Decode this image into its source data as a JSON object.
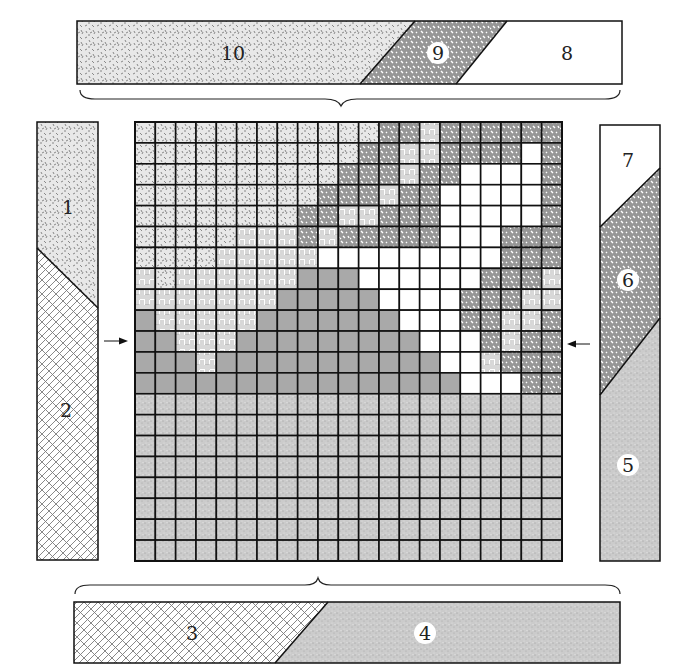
{
  "patterns": {
    "A": {
      "name": "light-speckle",
      "base": "#e6e6e6",
      "mark": "#8a8a8a"
    },
    "C": {
      "name": "dark-mottled",
      "base": "#9a9a9a",
      "mark": "#ffffff"
    },
    "W": {
      "name": "basketweave",
      "base": "#ffffff",
      "mark": "#9a9a9a"
    },
    "O": {
      "name": "white",
      "base": "#ffffff"
    },
    "G": {
      "name": "solid-gray",
      "base": "#a9a9a9"
    },
    "D": {
      "name": "fine-sand",
      "base": "#c8c8c8",
      "mark": "#a0a0a0"
    },
    "X": {
      "name": "crosshatch-maze",
      "base": "#ffffff",
      "mark": "#7a7a7a"
    }
  },
  "grid": {
    "rows": [
      "AAAAAAAAAAAACCWCCCCCC",
      "AAAAAAAAAAACCWWCCCCOC",
      "AAAAAAAAAACCCWCCOOOOC",
      "AAAAAAAAACCCWCCOOOOOC",
      "AAAAAAAACCWWCCCOOOOOC",
      "AAAAAWWWCWCCCCCOOOCCC",
      "AAAAWWWWWOOOOOOOOOCCC",
      "WAWWWWWWGGGOOOOOOCCCW",
      "WWWWWWWGGGGGOOOOCCCWW",
      "GWWWWWGGGGGGGOOOCCWWC",
      "GGWWWGGGGGGGGGOOOCWCC",
      "GGGWGGGGGGGGGGGOOWCCC",
      "GGGGGGGGGGGGGGGGOOOCC",
      "DDDDDDDDDDDDDDDDDDDDD",
      "DDDDDDDDDDDDDDDDDDDDD",
      "DDDDDDDDDDDDDDDDDDDDD",
      "DDDDDDDDDDDDDDDDDDDDD",
      "DDDDDDDDDDDDDDDDDDDDD",
      "DDDDDDDDDDDDDDDDDDDDD",
      "DDDDDDDDDDDDDDDDDDDDD",
      "DDDDDDDDDDDDDDDDDDDDD"
    ]
  },
  "bars": {
    "top": {
      "segments": [
        {
          "label": "10",
          "pattern": "A",
          "circled": false
        },
        {
          "label": "9",
          "pattern": "C",
          "circled": true
        },
        {
          "label": "8",
          "pattern": "O",
          "circled": false
        }
      ]
    },
    "left": {
      "segments": [
        {
          "label": "1",
          "pattern": "A",
          "circled": false
        },
        {
          "label": "2",
          "pattern": "X",
          "circled": false
        }
      ]
    },
    "right": {
      "segments": [
        {
          "label": "7",
          "pattern": "O",
          "circled": false
        },
        {
          "label": "6",
          "pattern": "C",
          "circled": true
        },
        {
          "label": "5",
          "pattern": "D",
          "circled": true
        }
      ]
    },
    "bottom": {
      "segments": [
        {
          "label": "3",
          "pattern": "X",
          "circled": false
        },
        {
          "label": "4",
          "pattern": "D",
          "circled": true
        }
      ]
    }
  },
  "arrows": {
    "left": "right-pointing",
    "right": "left-pointing"
  },
  "braces": [
    "top",
    "bottom"
  ]
}
